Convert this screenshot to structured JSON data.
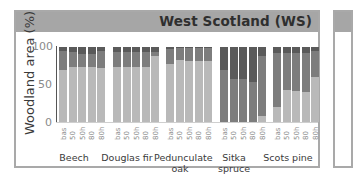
{
  "panel": {
    "title": "West Scotland (WS)"
  },
  "chart_data": {
    "type": "bar",
    "stacked": true,
    "title": "West Scotland (WS)",
    "xlabel": "",
    "ylabel": "Woodland area (%)",
    "ylim": [
      0,
      100
    ],
    "yticks": [
      "0",
      "50",
      "100"
    ],
    "grid": false,
    "legend": null,
    "groups": [
      "Beech",
      "Douglas fir",
      "Pedunculate oak",
      "Sitka spruce",
      "Scots pine"
    ],
    "categories": [
      "bas",
      "50",
      "50h",
      "80",
      "80h"
    ],
    "series": [
      {
        "name": "lower (light)",
        "color": "#b9b9b9",
        "values": {
          "Beech": [
            70,
            74,
            74,
            74,
            72
          ],
          "Douglas fir": [
            74,
            74,
            74,
            74,
            88
          ],
          "Pedunculate oak": [
            78,
            83,
            82,
            81,
            81
          ],
          "Sitka spruce": [
            0,
            0,
            0,
            0,
            8
          ],
          "Scots pine": [
            20,
            43,
            42,
            40,
            60
          ]
        }
      },
      {
        "name": "middle (medium)",
        "color": "#7d7d7d",
        "values": {
          "Beech": [
            25,
            19,
            17,
            17,
            23
          ],
          "Douglas fir": [
            20,
            20,
            20,
            20,
            6
          ],
          "Pedunculate oak": [
            20,
            16,
            17,
            18,
            18
          ],
          "Sitka spruce": [
            70,
            57,
            58,
            54,
            80
          ],
          "Scots pine": [
            72,
            49,
            50,
            52,
            35
          ]
        }
      },
      {
        "name": "upper (dark)",
        "color": "#5a5a5a",
        "values": {
          "Beech": [
            5,
            7,
            9,
            9,
            5
          ],
          "Douglas fir": [
            6,
            6,
            6,
            6,
            6
          ],
          "Pedunculate oak": [
            2,
            1,
            1,
            1,
            1
          ],
          "Sitka spruce": [
            30,
            43,
            42,
            46,
            12
          ],
          "Scots pine": [
            8,
            8,
            8,
            8,
            5
          ]
        }
      }
    ]
  },
  "y_axis": {
    "label": "Woodland area (%)",
    "ticks": [
      {
        "label": "100",
        "top": 40
      },
      {
        "label": "50",
        "top": 78
      },
      {
        "label": "0",
        "top": 116
      }
    ]
  },
  "x_axis": {
    "tick_labels": [
      "bas",
      "50",
      "50h",
      "80",
      "80h"
    ],
    "group_labels": [
      {
        "label": "Beech",
        "left": 48
      },
      {
        "label": "Douglas fir",
        "left": 101
      },
      {
        "label": "Pedunculate oak",
        "left": 154
      },
      {
        "label": "Sitka spruce",
        "left": 208
      },
      {
        "label": "Scots pine",
        "left": 262
      }
    ]
  }
}
